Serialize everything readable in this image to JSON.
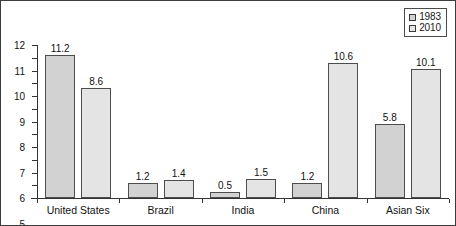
{
  "chart_data": {
    "type": "bar",
    "title": "",
    "subtitle": "",
    "xlabel": "",
    "ylabel": "",
    "categories": [
      "United States",
      "Brazil",
      "India",
      "China",
      "Asian Six"
    ],
    "series": [
      {
        "name": "1983",
        "color": "#d2d2d2",
        "values": [
          11.2,
          1.2,
          0.5,
          1.2,
          5.8
        ]
      },
      {
        "name": "2010",
        "color": "#e4e4e4",
        "values": [
          8.6,
          1.4,
          1.5,
          10.6,
          10.1
        ]
      }
    ],
    "ylim": [
      0,
      12
    ],
    "yticks": [
      0,
      1,
      2,
      3,
      4,
      5,
      6,
      7,
      8,
      9,
      10,
      11,
      12
    ],
    "ytick_labels": [
      "0",
      "1",
      "2",
      "3",
      "4",
      "5",
      "6",
      "7",
      "8",
      "9",
      "10",
      "11",
      "12"
    ],
    "grid": false,
    "legend_position": "top-right",
    "data_labels": true
  },
  "legend": {
    "entries": [
      {
        "label": "1983",
        "swatch_color": "#d2d2d2"
      },
      {
        "label": "2010",
        "swatch_color": "#e4e4e4"
      }
    ]
  },
  "colors": {
    "series_1983": "#d2d2d2",
    "series_2010": "#e4e4e4",
    "axis": "#333333",
    "frame": "#3c3c3c",
    "text": "#111111",
    "background": "#ffffff"
  }
}
